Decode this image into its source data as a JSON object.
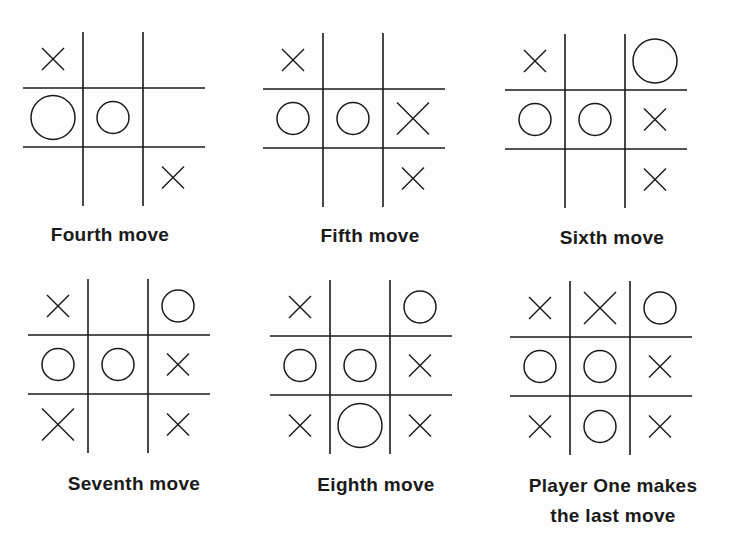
{
  "figure": {
    "panels": [
      {
        "caption": "Fourth move",
        "cells": [
          [
            "X",
            "",
            ""
          ],
          [
            "O",
            "O",
            ""
          ],
          [
            "",
            "",
            "X"
          ]
        ],
        "big": [
          [
            1,
            0
          ]
        ]
      },
      {
        "caption": "Fifth move",
        "cells": [
          [
            "X",
            "",
            ""
          ],
          [
            "O",
            "O",
            "X"
          ],
          [
            "",
            "",
            "X"
          ]
        ],
        "big": [
          [
            1,
            2
          ]
        ]
      },
      {
        "caption": "Sixth move",
        "cells": [
          [
            "X",
            "",
            "O"
          ],
          [
            "O",
            "O",
            "X"
          ],
          [
            "",
            "",
            "X"
          ]
        ],
        "big": [
          [
            0,
            2
          ]
        ]
      },
      {
        "caption": "Seventh move",
        "cells": [
          [
            "X",
            "",
            "O"
          ],
          [
            "O",
            "O",
            "X"
          ],
          [
            "X",
            "",
            "X"
          ]
        ],
        "big": [
          [
            2,
            0
          ]
        ]
      },
      {
        "caption": "Eighth move",
        "cells": [
          [
            "X",
            "",
            "O"
          ],
          [
            "O",
            "O",
            "X"
          ],
          [
            "X",
            "O",
            "X"
          ]
        ],
        "big": [
          [
            2,
            1
          ]
        ]
      },
      {
        "caption": "Player One makes the last move",
        "caption_lines": [
          "Player One makes",
          "the last move"
        ],
        "cells": [
          [
            "X",
            "X",
            "O"
          ],
          [
            "O",
            "O",
            "X"
          ],
          [
            "X",
            "O",
            "X"
          ]
        ],
        "big": [
          [
            0,
            1
          ]
        ]
      }
    ]
  }
}
